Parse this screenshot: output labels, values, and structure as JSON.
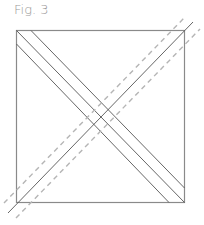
{
  "figure": {
    "caption": "Fig. 3",
    "colors": {
      "square": "#8a8a8a",
      "solid_lines": "#555555",
      "dashed_lines": "#b5b5b5",
      "caption": "#9a9a9a"
    }
  }
}
